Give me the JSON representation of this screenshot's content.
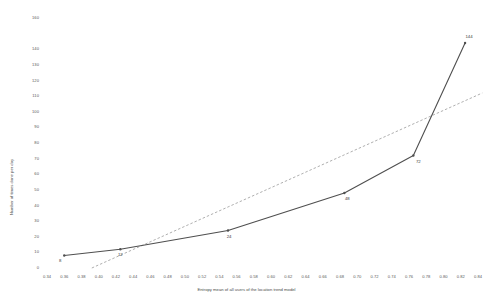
{
  "chart_data": {
    "type": "line",
    "title": "",
    "xlabel": "Entropy mean of all users of the location trend model",
    "ylabel": "Number of times done per day",
    "xlim": [
      0.34,
      0.84
    ],
    "ylim": [
      0,
      160
    ],
    "grid": false,
    "legend": "none",
    "x": [
      0.36,
      0.425,
      0.55,
      0.685,
      0.765,
      0.825
    ],
    "values": [
      8,
      12,
      24,
      48,
      72,
      144
    ],
    "point_labels": [
      "8",
      "12",
      "24",
      "48",
      "72",
      "144"
    ],
    "series": [
      {
        "name": "Number of times done per day",
        "style": "solid",
        "color": "#4f4f4f",
        "x": [
          0.36,
          0.425,
          0.55,
          0.685,
          0.765,
          0.825
        ],
        "values": [
          8,
          12,
          24,
          48,
          72,
          144
        ]
      },
      {
        "name": "Linear trendline",
        "style": "dashed",
        "color": "#8c8c8c",
        "x": [
          0.392,
          0.845
        ],
        "values": [
          0,
          112
        ]
      }
    ],
    "xticks": [
      "0.34",
      "0.36",
      "0.38",
      "0.40",
      "0.42",
      "0.44",
      "0.46",
      "0.48",
      "0.50",
      "0.52",
      "0.54",
      "0.56",
      "0.58",
      "0.60",
      "0.62",
      "0.64",
      "0.66",
      "0.68",
      "0.70",
      "0.72",
      "0.74",
      "0.76",
      "0.78",
      "0.80",
      "0.82",
      "0.84"
    ],
    "xtick_values": [
      0.34,
      0.36,
      0.38,
      0.4,
      0.42,
      0.44,
      0.46,
      0.48,
      0.5,
      0.52,
      0.54,
      0.56,
      0.58,
      0.6,
      0.62,
      0.64,
      0.66,
      0.68,
      0.7,
      0.72,
      0.74,
      0.76,
      0.78,
      0.8,
      0.82,
      0.84
    ],
    "yticks": [
      "0",
      "10",
      "20",
      "30",
      "40",
      "50",
      "60",
      "70",
      "80",
      "90",
      "100",
      "110",
      "120",
      "130",
      "140",
      "160"
    ],
    "ytick_values": [
      0,
      10,
      20,
      30,
      40,
      50,
      60,
      70,
      80,
      90,
      100,
      110,
      120,
      130,
      140,
      160
    ]
  }
}
